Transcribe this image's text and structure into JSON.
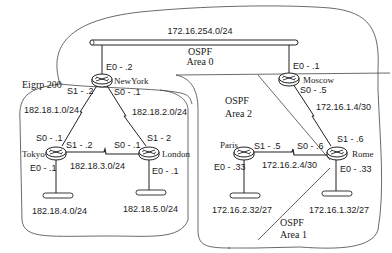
{
  "diagram": {
    "areas": {
      "ospf_area0": "OSPF\nArea 0",
      "ospf_area0_line1": "OSPF",
      "ospf_area0_line2": "Area 0",
      "ospf_area2_line1": "OSPF",
      "ospf_area2_line2": "Area 2",
      "ospf_area1_line1": "OSPF",
      "ospf_area1_line2": "Area 1",
      "eigrp": "Eigrp 200"
    },
    "networks": {
      "backbone": "172.16.254.0/24",
      "ny_tokyo": "182.18.1.0/24",
      "ny_london": "182.18.2.0/24",
      "tokyo_london": "182.18.3.0/24",
      "tokyo_lan": "182.18.4.0/24",
      "london_lan": "182.18.5.0/24",
      "moscow_rome": "172.16.1.4/30",
      "paris_rome": "172.16.2.4/30",
      "paris_lan": "172.16.2.32/27",
      "rome_lan": "172.16.1.32/27"
    },
    "routers": {
      "newyork": {
        "name": "NewYork",
        "e0": "E0 - .2",
        "s1": "S1 - .2",
        "s0": "S0 - .1"
      },
      "moscow": {
        "name": "Moscow",
        "e0": "E0 - .1",
        "s0": "S0 - .5"
      },
      "tokyo": {
        "name": "Tokyo",
        "s0": "S0 - .1",
        "s1": "S1 - .2",
        "e0": "E0 - .1"
      },
      "london": {
        "name": "London",
        "s0": "S0 - .1",
        "s1": "S1 - 2",
        "e0": "E0 - .1"
      },
      "paris": {
        "name": "Paris",
        "s1": "S1 - .5",
        "e0": "E0 - .33"
      },
      "rome": {
        "name": "Rome",
        "s0": "S0 - .6",
        "s1": "S1 - .6",
        "e0": "E0 - .33"
      }
    }
  }
}
